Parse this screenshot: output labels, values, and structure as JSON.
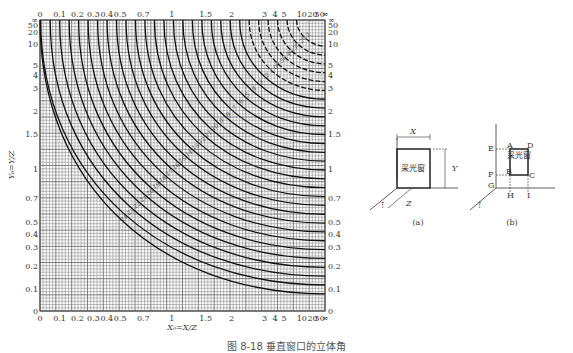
{
  "figure": {
    "caption": "图 8-18  垂直窗口的立体角",
    "x_axis_label": "X₀=X/Z",
    "y_axis_label": "Y₀=Y/Z"
  },
  "chart_data": {
    "type": "line",
    "title": "",
    "xlabel": "X₀=X/Z",
    "ylabel": "Y₀=Y/Z",
    "x_ticks": [
      "0",
      "0.1",
      "0.2",
      "0.3",
      "0.4",
      "0.5",
      "0.7",
      "1",
      "1.5",
      "2",
      "3",
      "4",
      "5",
      "10",
      "20",
      "50",
      "∞"
    ],
    "y_ticks": [
      "0",
      "0.1",
      "0.2",
      "0.3",
      "0.4",
      "0.5",
      "0.7",
      "1",
      "1.5",
      "2",
      "3",
      "4",
      "5",
      "10",
      "20",
      "50",
      "∞"
    ],
    "grid": true,
    "curve_labels": [
      "0.1",
      "0.2",
      "0.3",
      "0.4",
      "0.5",
      "1.0",
      "2",
      "3",
      "4",
      "5",
      "6",
      "7",
      "8",
      "9",
      "10",
      "11",
      "12",
      "13",
      "14",
      "15",
      "16",
      "17",
      "18",
      "19",
      "20",
      "21",
      "22",
      "23",
      "24"
    ],
    "note": "Family of iso-value curves (solid above ~1, dashed below) descending from top-left to bottom-right on a nonlinear scale"
  },
  "diagram_a": {
    "label": "(a)",
    "window_text": "采光窗",
    "dims": [
      "X",
      "Y",
      "Z"
    ]
  },
  "diagram_b": {
    "label": "(b)",
    "window_text": "采光窗",
    "points": [
      "A",
      "B",
      "C",
      "D",
      "E",
      "F",
      "G",
      "H",
      "I"
    ]
  }
}
